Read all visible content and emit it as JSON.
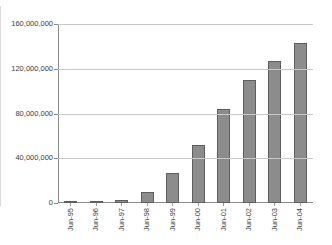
{
  "chart_data": {
    "type": "bar",
    "title": "",
    "xlabel": "",
    "ylabel": "",
    "categories": [
      "Jun-95",
      "Jun-96",
      "Jun-97",
      "Jun-98",
      "Jun-99",
      "Jun-00",
      "Jun-01",
      "Jun-02",
      "Jun-03",
      "Jun-04"
    ],
    "values": [
      500000,
      800000,
      2500000,
      10000000,
      27000000,
      52000000,
      84000000,
      110000000,
      127000000,
      143000000
    ],
    "ylim": [
      0,
      160000000
    ],
    "yticks": [
      0,
      40000000,
      80000000,
      120000000,
      160000000
    ],
    "ytick_labels": [
      "0",
      "40,000,000",
      "80,000,000",
      "120,000,000",
      "160,000,000"
    ],
    "grid": true,
    "legend": false,
    "bar_color": "#8c8c8c",
    "bar_border_color": "#5e5e5e",
    "gridline_color": "#c9c9c9",
    "axis_color": "#8a8a8a"
  }
}
